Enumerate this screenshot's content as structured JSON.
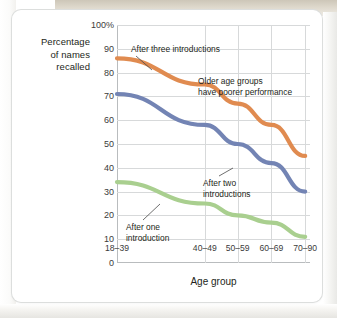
{
  "chart_data": {
    "type": "line",
    "title": "",
    "xlabel": "Age group",
    "ylabel": "Percentage of names recalled",
    "ylabel_lines": [
      "Percentage",
      "of names",
      "recalled"
    ],
    "categories": [
      "18–39",
      "40–49",
      "50–59",
      "60–69",
      "70–90"
    ],
    "ylim": [
      0,
      100
    ],
    "yticks": [
      0,
      10,
      20,
      30,
      40,
      50,
      60,
      70,
      80,
      90,
      100
    ],
    "ytick_labels": [
      "0",
      "10",
      "20",
      "30",
      "40",
      "50",
      "60",
      "70",
      "80",
      "90",
      "100%"
    ],
    "grid": true,
    "legend": "none",
    "series": [
      {
        "name": "After three introductions",
        "color": "#e08b50",
        "values": [
          86,
          75,
          67,
          58,
          45
        ]
      },
      {
        "name": "After two introductions",
        "color": "#7384b4",
        "values": [
          71,
          58,
          50,
          42,
          30
        ]
      },
      {
        "name": "After one introduction",
        "color": "#a9cf8f",
        "values": [
          34,
          25,
          20,
          17,
          11
        ]
      }
    ],
    "annotations": [
      {
        "id": "after-three",
        "text": "After three introductions",
        "lines": [
          "After three introductions"
        ],
        "leader": true
      },
      {
        "id": "older-age-groups",
        "text": "Older age groups have poorer performance",
        "lines": [
          "Older age groups",
          "have poorer performance"
        ],
        "leader": false
      },
      {
        "id": "after-two",
        "text": "After two introductions",
        "lines": [
          "After two",
          "introductions"
        ],
        "leader": true
      },
      {
        "id": "after-one",
        "text": "After one introduction",
        "lines": [
          "After one",
          "introduction"
        ],
        "leader": true
      }
    ],
    "axis_color": "#b9bcbe",
    "grid_color": "#d7d9da"
  }
}
